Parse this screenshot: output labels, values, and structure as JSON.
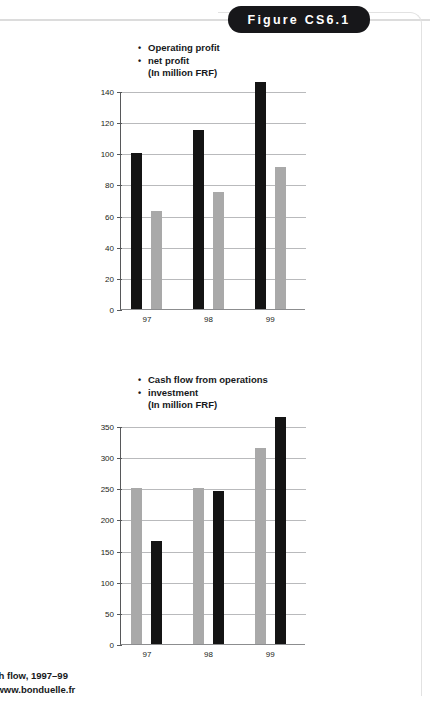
{
  "figure": {
    "tab_label": "Figure CS6.1"
  },
  "caption": {
    "line1": "ash flow, 1997–99",
    "line2": "://www.bonduelle.fr"
  },
  "colors": {
    "dark_series": "#141414",
    "light_series": "#a9a9a9",
    "tab_background": "#17171a",
    "gridline": "#b9babc",
    "axis": "#57585a"
  },
  "chart_data": [
    {
      "type": "bar",
      "title": "",
      "legend": {
        "entries": [
          "Operating profit",
          "net profit"
        ],
        "units": "(In million FRF)",
        "position": "above-plot"
      },
      "categories": [
        "97",
        "98",
        "99"
      ],
      "series": [
        {
          "name": "Operating profit",
          "color": "#141414",
          "values": [
            100,
            115,
            146
          ]
        },
        {
          "name": "net profit",
          "color": "#a9a9a9",
          "values": [
            63,
            75,
            91
          ]
        }
      ],
      "xlabel": "",
      "ylabel": "",
      "ylim": [
        0,
        140
      ],
      "yticks": [
        0,
        20,
        40,
        60,
        80,
        100,
        120,
        140
      ],
      "grid": true
    },
    {
      "type": "bar",
      "title": "",
      "legend": {
        "entries": [
          "Cash flow from operations",
          "investment"
        ],
        "units": "(In million FRF)",
        "position": "above-plot"
      },
      "categories": [
        "97",
        "98",
        "99"
      ],
      "series": [
        {
          "name": "Cash flow from operations",
          "color": "#a9a9a9",
          "values": [
            250,
            250,
            315
          ]
        },
        {
          "name": "investment",
          "color": "#141414",
          "values": [
            165,
            245,
            365
          ]
        }
      ],
      "xlabel": "",
      "ylabel": "",
      "ylim": [
        0,
        350
      ],
      "yticks": [
        0,
        50,
        100,
        150,
        200,
        250,
        300,
        350
      ],
      "grid": true
    }
  ]
}
